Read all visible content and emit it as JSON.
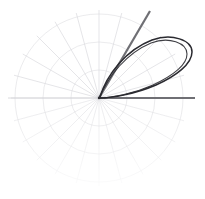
{
  "figure": {
    "name": "polar-plot",
    "width": 205,
    "height": 199,
    "background": "#ffffff"
  },
  "chart_data": {
    "type": "line",
    "title": "",
    "subtitle": "",
    "xlabel": "",
    "ylabel": "",
    "projection": "polar",
    "grid": true,
    "legend": null,
    "legend_position": "none",
    "origin_px": {
      "x": 99,
      "y": 98
    },
    "radial_axis": {
      "rmin": 0,
      "rmax": 1.0,
      "tick_values": [
        0.33,
        0.66,
        1.0
      ],
      "tick_labels": [],
      "tick_radii_px": [
        28,
        56,
        84
      ],
      "grid_color": "#d8d8dc"
    },
    "angular_axis": {
      "theta_min_deg": 0,
      "theta_max_deg": 360,
      "tick_step_deg": 15,
      "tick_labels": [],
      "spoke_color": "#c9c9cf",
      "spoke_radius_px": 88,
      "theta_direction": "counterclockwise",
      "theta_zero_location": "E"
    },
    "series": [
      {
        "name": "polar-axis-line",
        "kind": "ray",
        "theta_deg": 0,
        "r_start": 0,
        "r_end": 1.12,
        "color": "#6f6f74",
        "width_px": 2.2,
        "x_end_px": 195,
        "y_end_px": 98
      },
      {
        "name": "polar-ray-60",
        "kind": "ray",
        "theta_deg": 60,
        "r_start": 0,
        "r_end": 1.18,
        "color": "#6f6f74",
        "width_px": 2.2,
        "x_end_px": 150,
        "y_end_px": 11
      },
      {
        "name": "petal-curve",
        "kind": "closed-loop",
        "color": "#2a2a30",
        "width_px": 1.5,
        "description": "teardrop loop from origin, axis about 28 degrees, tip at origin",
        "theta_start_deg": 55,
        "theta_end_deg": 2,
        "r_max": 1.1,
        "bounds_px": {
          "x_min": 99,
          "y_min": 38,
          "x_max": 193,
          "y_max": 99
        }
      },
      {
        "name": "petal-curve-inner-edge",
        "kind": "open-arc",
        "color": "#2a2a30",
        "width_px": 1.2,
        "description": "inner return edge of the loop sweeping back to origin"
      }
    ],
    "annotations": []
  },
  "colors": {
    "background": "#ffffff",
    "grid_light": "#dcdce0",
    "grid_spoke": "#c9c9cf",
    "accent_gray": "#6f6f74",
    "curve_dark": "#2a2a30"
  }
}
